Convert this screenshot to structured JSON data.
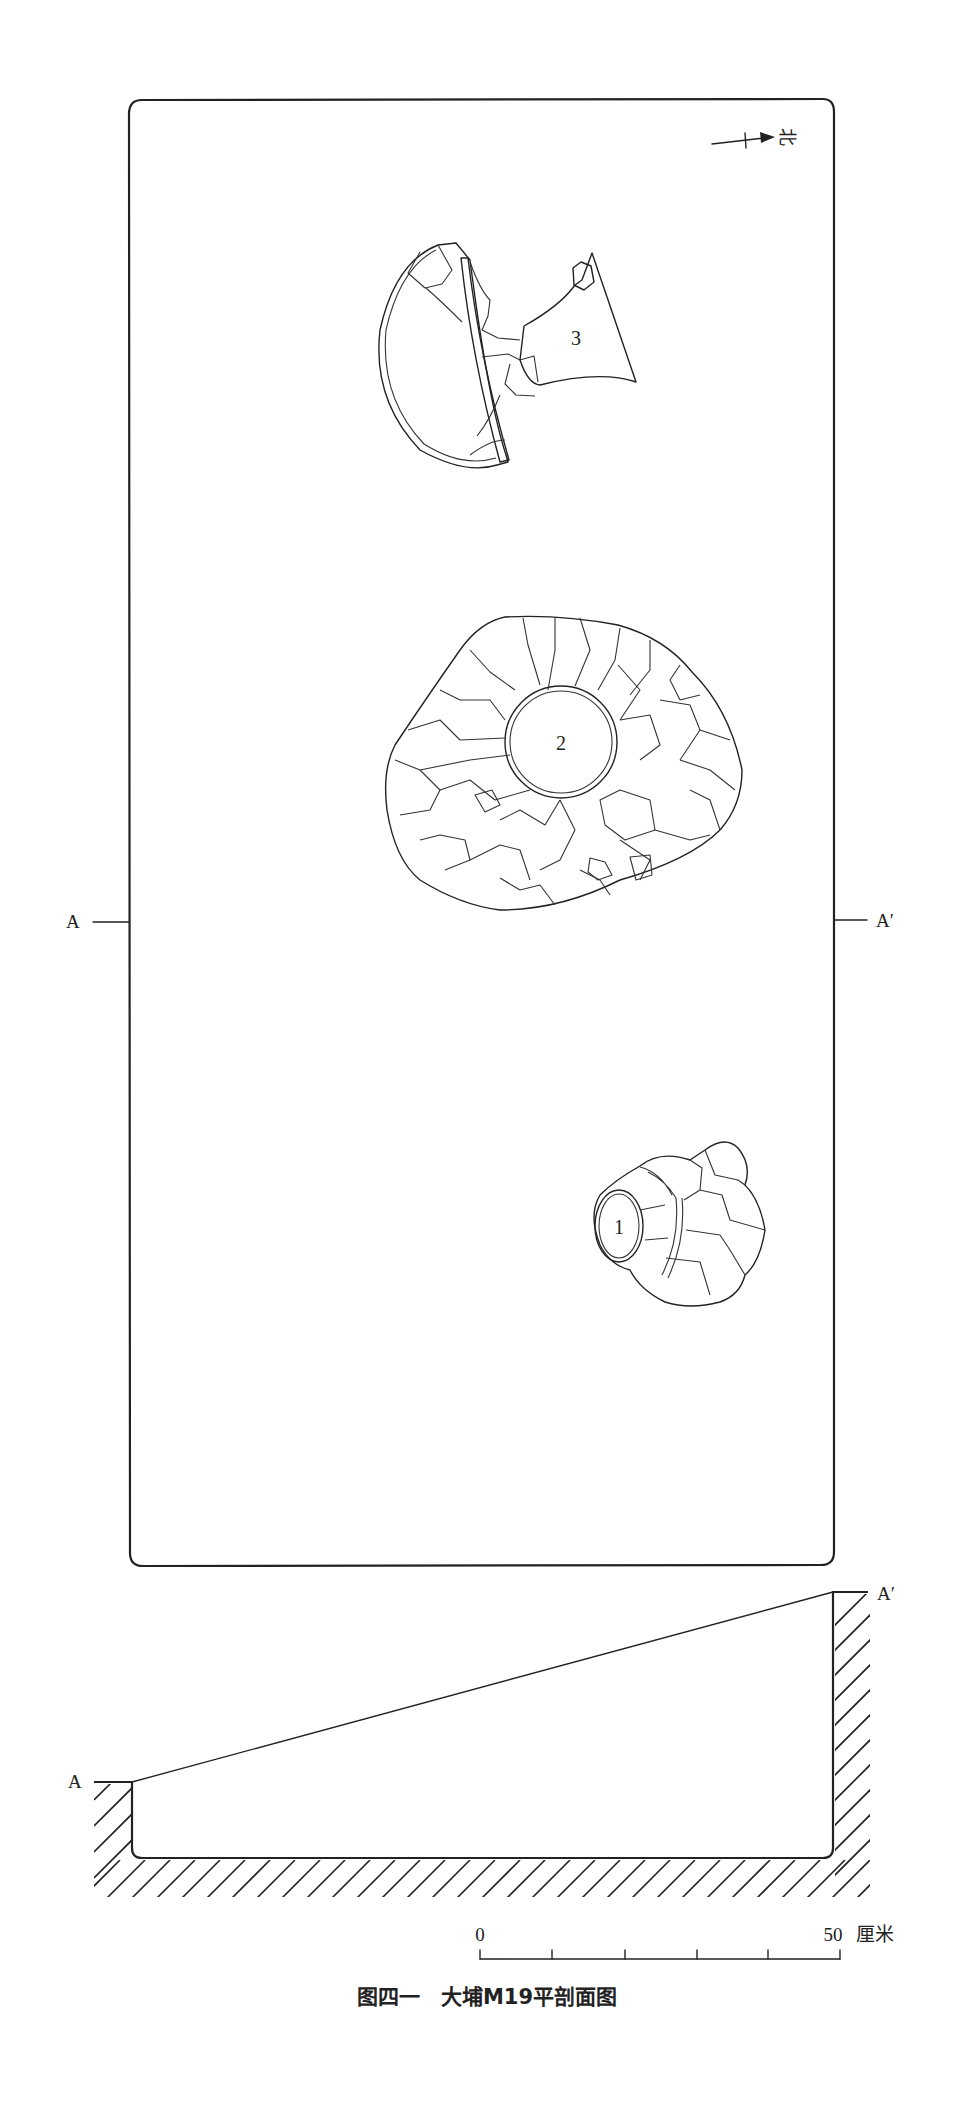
{
  "figure": {
    "caption": "图四一　大埔M19平剖面图",
    "north_label": "北",
    "plan": {
      "section_start_label": "A",
      "section_end_label": "A′",
      "objects": [
        {
          "id": "1",
          "label": "1"
        },
        {
          "id": "2",
          "label": "2"
        },
        {
          "id": "3",
          "label": "3"
        }
      ]
    },
    "section": {
      "start_label": "A",
      "end_label": "A′"
    },
    "scale_bar": {
      "start_label": "0",
      "end_label": "50",
      "unit": "厘米",
      "divisions": 5
    }
  },
  "colors": {
    "line": "#222222",
    "background": "#ffffff"
  }
}
